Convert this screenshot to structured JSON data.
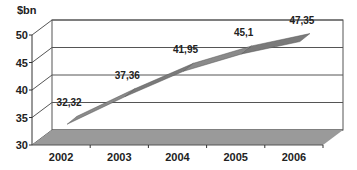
{
  "chart_data": {
    "type": "line",
    "style": "3d-ribbon",
    "title": "",
    "ylabel": "$bn",
    "xlabel": "",
    "categories": [
      "2002",
      "2003",
      "2004",
      "2005",
      "2006"
    ],
    "series": [
      {
        "name": "$bn",
        "values": [
          32.32,
          37.36,
          41.95,
          45.1,
          47.35
        ]
      }
    ],
    "data_labels": [
      "32,32",
      "37,36",
      "41,95",
      "45,1",
      "47,35"
    ],
    "ylim": [
      30,
      50
    ],
    "yticks": [
      "30",
      "35",
      "40",
      "45",
      "50"
    ],
    "grid": true,
    "legend": "none",
    "colors": {
      "ribbon": "#8a8a8a",
      "floor": "#9a9a9a",
      "grid": "#555555"
    }
  }
}
